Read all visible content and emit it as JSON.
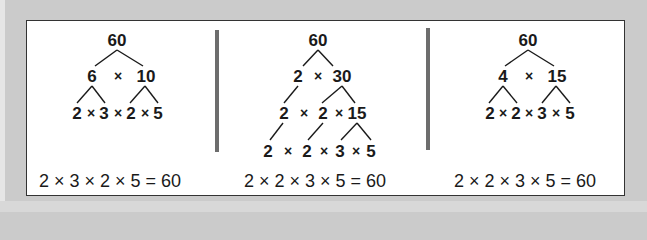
{
  "colors": {
    "background": "#cbcbcb",
    "panel": "#ffffff",
    "panel_border": "#333333",
    "divider": "#6d6d6d",
    "text": "#1a1a1a"
  },
  "trees": [
    {
      "root": "60",
      "level1": {
        "left": "6",
        "op": "×",
        "right": "10"
      },
      "leaves": [
        "2",
        "×",
        "3",
        "×",
        "2",
        "×",
        "5"
      ],
      "equation": "2 × 3 × 2 × 5 = 60"
    },
    {
      "root": "60",
      "level1": {
        "left": "2",
        "op": "×",
        "right": "30"
      },
      "level2": [
        "2",
        "×",
        "2",
        "×",
        "15"
      ],
      "leaves": [
        "2",
        "×",
        "2",
        "×",
        "3",
        "×",
        "5"
      ],
      "equation": "2 × 2 × 3 × 5 = 60"
    },
    {
      "root": "60",
      "level1": {
        "left": "4",
        "op": "×",
        "right": "15"
      },
      "leaves": [
        "2",
        "×",
        "2",
        "×",
        "3",
        "×",
        "5"
      ],
      "equation": "2 × 2 × 3 × 5 = 60"
    }
  ]
}
